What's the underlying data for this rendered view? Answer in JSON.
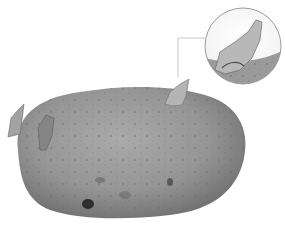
{
  "image": {
    "subject": "sprouting potato",
    "description": "Grayscale photograph of a potato with several sprouts (eyes), with a circular magnified inset of one sprout connected by a leader line",
    "colors": {
      "background": "#ffffff",
      "potato_light": "#a8a8a8",
      "potato_mid": "#8c8c8c",
      "potato_dark": "#5e5e5e",
      "sprout": "#b9b9b9",
      "inset_border": "#9a9a9a",
      "leader_line": "#c8c8c8"
    },
    "inset": {
      "shape": "circle",
      "content": "magnified sprout"
    }
  }
}
